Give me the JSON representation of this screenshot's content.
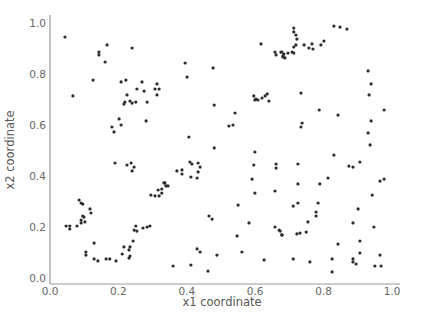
{
  "chart_data": {
    "type": "scatter",
    "title": "",
    "xlabel": "x1 coordinate",
    "ylabel": "x2 coordinate",
    "xlim": [
      0.0,
      1.0
    ],
    "ylim": [
      0.0,
      1.0
    ],
    "xticks": [
      "0.0",
      "0.2",
      "0.4",
      "0.6",
      "0.8",
      "1.0"
    ],
    "yticks": [
      "0.0",
      "0.2",
      "0.4",
      "0.6",
      "0.8",
      "1.0"
    ],
    "grid": false,
    "legend": null,
    "marker_color": "#2b2b2b",
    "series": [
      {
        "name": "points",
        "points": [
          [
            0.044,
            0.945
          ],
          [
            0.167,
            0.914
          ],
          [
            0.143,
            0.886
          ],
          [
            0.143,
            0.875
          ],
          [
            0.161,
            0.847
          ],
          [
            0.24,
            0.902
          ],
          [
            0.126,
            0.776
          ],
          [
            0.067,
            0.714
          ],
          [
            0.208,
            0.769
          ],
          [
            0.222,
            0.776
          ],
          [
            0.269,
            0.769
          ],
          [
            0.254,
            0.741
          ],
          [
            0.275,
            0.733
          ],
          [
            0.313,
            0.761
          ],
          [
            0.307,
            0.741
          ],
          [
            0.319,
            0.741
          ],
          [
            0.313,
            0.718
          ],
          [
            0.225,
            0.718
          ],
          [
            0.219,
            0.69
          ],
          [
            0.216,
            0.682
          ],
          [
            0.234,
            0.694
          ],
          [
            0.24,
            0.686
          ],
          [
            0.251,
            0.69
          ],
          [
            0.284,
            0.69
          ],
          [
            0.202,
            0.624
          ],
          [
            0.208,
            0.6
          ],
          [
            0.281,
            0.616
          ],
          [
            0.187,
            0.573
          ],
          [
            0.181,
            0.592
          ],
          [
            0.19,
            0.451
          ],
          [
            0.225,
            0.443
          ],
          [
            0.237,
            0.451
          ],
          [
            0.246,
            0.435
          ],
          [
            0.24,
            0.42
          ],
          [
            0.333,
            0.373
          ],
          [
            0.339,
            0.361
          ],
          [
            0.327,
            0.349
          ],
          [
            0.316,
            0.345
          ],
          [
            0.295,
            0.325
          ],
          [
            0.307,
            0.322
          ],
          [
            0.319,
            0.322
          ],
          [
            0.327,
            0.333
          ],
          [
            0.085,
            0.306
          ],
          [
            0.091,
            0.294
          ],
          [
            0.096,
            0.29
          ],
          [
            0.117,
            0.271
          ],
          [
            0.12,
            0.255
          ],
          [
            0.096,
            0.243
          ],
          [
            0.102,
            0.22
          ],
          [
            0.047,
            0.204
          ],
          [
            0.058,
            0.204
          ],
          [
            0.058,
            0.192
          ],
          [
            0.079,
            0.204
          ],
          [
            0.091,
            0.216
          ],
          [
            0.091,
            0.227
          ],
          [
            0.099,
            0.239
          ],
          [
            0.129,
            0.137
          ],
          [
            0.105,
            0.102
          ],
          [
            0.105,
            0.09
          ],
          [
            0.129,
            0.075
          ],
          [
            0.14,
            0.067
          ],
          [
            0.164,
            0.075
          ],
          [
            0.175,
            0.075
          ],
          [
            0.193,
            0.067
          ],
          [
            0.211,
            0.094
          ],
          [
            0.216,
            0.122
          ],
          [
            0.234,
            0.122
          ],
          [
            0.231,
            0.11
          ],
          [
            0.234,
            0.086
          ],
          [
            0.231,
            0.078
          ],
          [
            0.243,
            0.145
          ],
          [
            0.246,
            0.188
          ],
          [
            0.251,
            0.204
          ],
          [
            0.254,
            0.184
          ],
          [
            0.272,
            0.196
          ],
          [
            0.284,
            0.2
          ],
          [
            0.292,
            0.204
          ],
          [
            0.395,
            0.843
          ],
          [
            0.401,
            0.788
          ],
          [
            0.477,
            0.824
          ],
          [
            0.617,
            0.918
          ],
          [
            0.658,
            0.886
          ],
          [
            0.661,
            0.875
          ],
          [
            0.675,
            0.886
          ],
          [
            0.681,
            0.867
          ],
          [
            0.684,
            0.878
          ],
          [
            0.48,
            0.678
          ],
          [
            0.541,
            0.647
          ],
          [
            0.523,
            0.596
          ],
          [
            0.535,
            0.6
          ],
          [
            0.596,
            0.714
          ],
          [
            0.602,
            0.702
          ],
          [
            0.608,
            0.698
          ],
          [
            0.62,
            0.706
          ],
          [
            0.629,
            0.714
          ],
          [
            0.635,
            0.722
          ],
          [
            0.64,
            0.694
          ],
          [
            0.599,
            0.698
          ],
          [
            0.406,
            0.553
          ],
          [
            0.48,
            0.51
          ],
          [
            0.599,
            0.494
          ],
          [
            0.596,
            0.443
          ],
          [
            0.591,
            0.388
          ],
          [
            0.599,
            0.333
          ],
          [
            0.661,
            0.447
          ],
          [
            0.661,
            0.431
          ],
          [
            0.658,
            0.341
          ],
          [
            0.409,
            0.455
          ],
          [
            0.415,
            0.447
          ],
          [
            0.433,
            0.451
          ],
          [
            0.439,
            0.435
          ],
          [
            0.371,
            0.42
          ],
          [
            0.386,
            0.424
          ],
          [
            0.386,
            0.408
          ],
          [
            0.412,
            0.396
          ],
          [
            0.433,
            0.416
          ],
          [
            0.43,
            0.392
          ],
          [
            0.336,
            0.373
          ],
          [
            0.345,
            0.361
          ],
          [
            0.55,
            0.286
          ],
          [
            0.465,
            0.243
          ],
          [
            0.474,
            0.231
          ],
          [
            0.582,
            0.216
          ],
          [
            0.658,
            0.2
          ],
          [
            0.67,
            0.188
          ],
          [
            0.678,
            0.169
          ],
          [
            0.547,
            0.165
          ],
          [
            0.43,
            0.114
          ],
          [
            0.439,
            0.102
          ],
          [
            0.488,
            0.09
          ],
          [
            0.561,
            0.102
          ],
          [
            0.626,
            0.071
          ],
          [
            0.36,
            0.047
          ],
          [
            0.412,
            0.051
          ],
          [
            0.462,
            0.027
          ],
          [
            0.713,
            0.98
          ],
          [
            0.713,
            0.965
          ],
          [
            0.719,
            0.953
          ],
          [
            0.722,
            0.937
          ],
          [
            0.719,
            0.914
          ],
          [
            0.713,
            0.906
          ],
          [
            0.708,
            0.886
          ],
          [
            0.713,
            0.882
          ],
          [
            0.696,
            0.882
          ],
          [
            0.678,
            0.886
          ],
          [
            0.681,
            0.871
          ],
          [
            0.687,
            0.863
          ],
          [
            0.743,
            0.914
          ],
          [
            0.757,
            0.902
          ],
          [
            0.766,
            0.918
          ],
          [
            0.769,
            0.898
          ],
          [
            0.792,
            0.914
          ],
          [
            0.801,
            0.929
          ],
          [
            0.83,
            0.988
          ],
          [
            0.848,
            0.984
          ],
          [
            0.868,
            0.976
          ],
          [
            0.93,
            0.812
          ],
          [
            0.939,
            0.761
          ],
          [
            0.933,
            0.718
          ],
          [
            0.977,
            0.659
          ],
          [
            0.939,
            0.616
          ],
          [
            0.93,
            0.569
          ],
          [
            0.936,
            0.522
          ],
          [
            0.734,
            0.725
          ],
          [
            0.787,
            0.659
          ],
          [
            0.842,
            0.639
          ],
          [
            0.737,
            0.608
          ],
          [
            0.734,
            0.592
          ],
          [
            0.83,
            0.482
          ],
          [
            0.725,
            0.447
          ],
          [
            0.874,
            0.439
          ],
          [
            0.886,
            0.435
          ],
          [
            0.906,
            0.455
          ],
          [
            0.725,
            0.369
          ],
          [
            0.789,
            0.369
          ],
          [
            0.813,
            0.392
          ],
          [
            0.965,
            0.38
          ],
          [
            0.977,
            0.388
          ],
          [
            0.942,
            0.325
          ],
          [
            0.711,
            0.282
          ],
          [
            0.725,
            0.294
          ],
          [
            0.784,
            0.294
          ],
          [
            0.778,
            0.259
          ],
          [
            0.778,
            0.243
          ],
          [
            0.754,
            0.22
          ],
          [
            0.749,
            0.18
          ],
          [
            0.731,
            0.176
          ],
          [
            0.722,
            0.173
          ],
          [
            0.673,
            0.184
          ],
          [
            0.678,
            0.169
          ],
          [
            0.901,
            0.271
          ],
          [
            0.886,
            0.216
          ],
          [
            0.947,
            0.2
          ],
          [
            0.842,
            0.133
          ],
          [
            0.906,
            0.145
          ],
          [
            0.906,
            0.098
          ],
          [
            0.965,
            0.09
          ],
          [
            0.711,
            0.075
          ],
          [
            0.76,
            0.063
          ],
          [
            0.825,
            0.075
          ],
          [
            0.886,
            0.075
          ],
          [
            0.886,
            0.063
          ],
          [
            0.895,
            0.055
          ],
          [
            0.825,
            0.024
          ],
          [
            0.95,
            0.047
          ],
          [
            0.968,
            0.047
          ]
        ]
      }
    ]
  }
}
